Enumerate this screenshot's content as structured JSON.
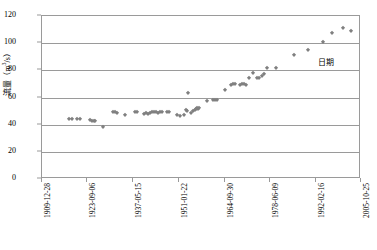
{
  "chart_data": {
    "type": "scatter",
    "title": "",
    "xlabel": "日期",
    "ylabel": "流量（m3/s）",
    "ylabel_base": "流量（m",
    "ylabel_sup": "3",
    "ylabel_tail": "/s）",
    "ylim": [
      0,
      120
    ],
    "yticks": [
      0,
      20,
      40,
      60,
      80,
      100,
      120
    ],
    "ytick_labels": [
      "0",
      "20",
      "40",
      "60",
      "80",
      "100",
      "120"
    ],
    "xtick_labels": [
      "1909-12-28",
      "1923-09-06",
      "1937-05-15",
      "1951-01-22",
      "1964-09-30",
      "1978-06-09",
      "1992-02-16",
      "2005-10-25"
    ],
    "xtick_positions_px": [
      41,
      86,
      132,
      178,
      224,
      269,
      315,
      360
    ],
    "grid": "horizontal",
    "legend": "none",
    "marker": "diamond",
    "marker_color": "#808080",
    "axis_color": "#9a9a9a",
    "series": [
      {
        "name": "流量",
        "points": [
          {
            "x": 68,
            "y": 44
          },
          {
            "x": 71,
            "y": 44
          },
          {
            "x": 76,
            "y": 44
          },
          {
            "x": 79,
            "y": 44
          },
          {
            "x": 89,
            "y": 43.5
          },
          {
            "x": 91,
            "y": 43
          },
          {
            "x": 92.5,
            "y": 43
          },
          {
            "x": 94,
            "y": 43
          },
          {
            "x": 102,
            "y": 38.5
          },
          {
            "x": 112,
            "y": 49
          },
          {
            "x": 114,
            "y": 49
          },
          {
            "x": 116,
            "y": 48.5
          },
          {
            "x": 124,
            "y": 47
          },
          {
            "x": 134,
            "y": 49.5
          },
          {
            "x": 136,
            "y": 49
          },
          {
            "x": 143,
            "y": 48
          },
          {
            "x": 145,
            "y": 48.5
          },
          {
            "x": 147,
            "y": 48
          },
          {
            "x": 149,
            "y": 48.5
          },
          {
            "x": 151,
            "y": 49
          },
          {
            "x": 153,
            "y": 49
          },
          {
            "x": 155,
            "y": 49
          },
          {
            "x": 157,
            "y": 48.5
          },
          {
            "x": 159,
            "y": 49
          },
          {
            "x": 161,
            "y": 49
          },
          {
            "x": 166,
            "y": 49
          },
          {
            "x": 168,
            "y": 49
          },
          {
            "x": 176,
            "y": 47
          },
          {
            "x": 179,
            "y": 46.5
          },
          {
            "x": 183,
            "y": 47
          },
          {
            "x": 185,
            "y": 51
          },
          {
            "x": 186,
            "y": 50
          },
          {
            "x": 187,
            "y": 63.5
          },
          {
            "x": 190,
            "y": 48.5
          },
          {
            "x": 192,
            "y": 50
          },
          {
            "x": 194,
            "y": 51
          },
          {
            "x": 195,
            "y": 51.5
          },
          {
            "x": 196,
            "y": 52
          },
          {
            "x": 197,
            "y": 51.5
          },
          {
            "x": 198,
            "y": 52
          },
          {
            "x": 206,
            "y": 57.5
          },
          {
            "x": 212,
            "y": 58
          },
          {
            "x": 214,
            "y": 58
          },
          {
            "x": 216,
            "y": 58.5
          },
          {
            "x": 224,
            "y": 65.5
          },
          {
            "x": 230,
            "y": 69.5
          },
          {
            "x": 232,
            "y": 70
          },
          {
            "x": 234,
            "y": 70
          },
          {
            "x": 239,
            "y": 69.5
          },
          {
            "x": 241,
            "y": 70
          },
          {
            "x": 243,
            "y": 70
          },
          {
            "x": 245,
            "y": 69.5
          },
          {
            "x": 248,
            "y": 74.5
          },
          {
            "x": 252,
            "y": 78
          },
          {
            "x": 256,
            "y": 74.5
          },
          {
            "x": 258,
            "y": 74
          },
          {
            "x": 261,
            "y": 76
          },
          {
            "x": 263,
            "y": 77
          },
          {
            "x": 266,
            "y": 82
          },
          {
            "x": 275,
            "y": 82
          },
          {
            "x": 293,
            "y": 91
          },
          {
            "x": 307,
            "y": 95
          },
          {
            "x": 322,
            "y": 101
          },
          {
            "x": 331,
            "y": 107.5
          },
          {
            "x": 342,
            "y": 111
          },
          {
            "x": 350,
            "y": 109
          }
        ]
      }
    ]
  }
}
